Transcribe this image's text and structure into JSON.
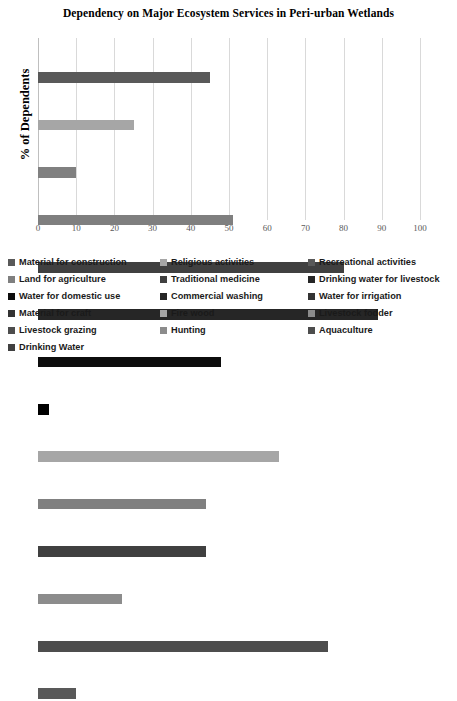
{
  "chart_data": {
    "type": "bar",
    "orientation": "horizontal",
    "title": "Dependency on Major Ecosystem Services in Peri-urban Wetlands",
    "xlabel": "",
    "ylabel": "% of Dependents",
    "xlim": [
      0,
      100
    ],
    "xticks": [
      0,
      10,
      20,
      30,
      40,
      50,
      60,
      70,
      80,
      90,
      100
    ],
    "grid": true,
    "legend_position": "bottom",
    "categories": [
      "Material for construction",
      "Religious activities",
      "Recreational activities",
      "Land for agriculture",
      "Traditional medicine",
      "Drinking water for livestock",
      "Water for domestic use",
      "Commercial washing",
      "Water for irrigation",
      "Material for craft",
      "Fire wood",
      "Livestock fodder",
      "Livestock grazing",
      "Hunting",
      "Aquaculture",
      "Drinking Water"
    ],
    "bars": [
      {
        "label": "Material for construction",
        "value": 45,
        "color": "#595959"
      },
      {
        "label": "Religious activities",
        "value": 25,
        "color": "#a6a6a6"
      },
      {
        "label": "Recreational activities",
        "value": 10,
        "color": "#808080"
      },
      {
        "label": "Land for agriculture",
        "value": 51,
        "color": "#7f7f7f"
      },
      {
        "label": "Traditional medicine",
        "value": 80,
        "color": "#404040"
      },
      {
        "label": "Drinking water for livestock",
        "value": 89,
        "color": "#262626"
      },
      {
        "label": "Water for domestic use",
        "value": 48,
        "color": "#0d0d0d"
      },
      {
        "label": "Commercial washing",
        "value": 3,
        "color": "#000000"
      },
      {
        "label": "Water for irrigation",
        "value": 63,
        "color": "#a6a6a6"
      },
      {
        "label": "Material for craft",
        "value": 44,
        "color": "#808080"
      },
      {
        "label": "Fire wood",
        "value": 44,
        "color": "#404040"
      },
      {
        "label": "Livestock fodder",
        "value": 22,
        "color": "#8c8c8c"
      },
      {
        "label": "Livestock grazing",
        "value": 76,
        "color": "#4d4d4d"
      },
      {
        "label": "Hunting",
        "value": 10,
        "color": "#595959"
      }
    ]
  },
  "legend": {
    "column1": [
      {
        "label": "Material for construction",
        "color": "#595959"
      },
      {
        "label": "Land for agriculture",
        "color": "#7f7f7f"
      },
      {
        "label": "Water for domestic use",
        "color": "#0d0d0d"
      },
      {
        "label": "Material for craft",
        "color": "#333333"
      },
      {
        "label": "Livestock grazing",
        "color": "#4d4d4d"
      },
      {
        "label": "Drinking Water",
        "color": "#404040"
      }
    ],
    "column2": [
      {
        "label": "Religious activities",
        "color": "#a6a6a6"
      },
      {
        "label": "Traditional medicine",
        "color": "#404040"
      },
      {
        "label": "Commercial washing",
        "color": "#262626"
      },
      {
        "label": "Fire wood",
        "color": "#a6a6a6"
      },
      {
        "label": "Hunting",
        "color": "#8c8c8c"
      }
    ],
    "column3": [
      {
        "label": "Recreational activities",
        "color": "#595959"
      },
      {
        "label": "Drinking water for livestock",
        "color": "#262626"
      },
      {
        "label": "Water for irrigation",
        "color": "#333333"
      },
      {
        "label": "Livestock fodder",
        "color": "#8c8c8c"
      },
      {
        "label": "Aquaculture",
        "color": "#4d4d4d"
      }
    ]
  }
}
